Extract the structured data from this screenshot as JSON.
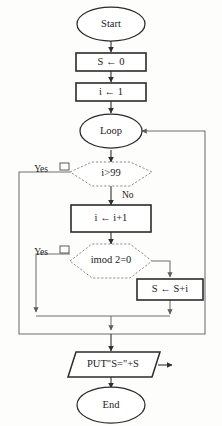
{
  "diagram": {
    "type": "flowchart",
    "colors": {
      "background": "#fdfdfc",
      "process_stroke": "#2b2b2b",
      "decision_stroke": "#8d8d8d",
      "connector": "#6f6f6f",
      "text": "#1a1a1a"
    },
    "nodes": [
      {
        "id": "start",
        "shape": "terminal",
        "label": "Start"
      },
      {
        "id": "init_s",
        "shape": "process",
        "label": "S ← 0"
      },
      {
        "id": "init_i",
        "shape": "process",
        "label": "i ← 1"
      },
      {
        "id": "loop",
        "shape": "terminal",
        "label": "Loop"
      },
      {
        "id": "cond_i99",
        "shape": "decision",
        "label": "i>99"
      },
      {
        "id": "incr_i",
        "shape": "process",
        "label": "i ←  i+1"
      },
      {
        "id": "cond_even",
        "shape": "decision",
        "label": "imod 2=0"
      },
      {
        "id": "accum_s",
        "shape": "process",
        "label": "S ← S+i"
      },
      {
        "id": "output",
        "shape": "io",
        "label": "PUT\"S=\"+S"
      },
      {
        "id": "end",
        "shape": "terminal",
        "label": "End"
      }
    ],
    "branch_labels": {
      "yes_i99": "Yes",
      "no_i99": "No",
      "yes_even": "Yes"
    }
  }
}
